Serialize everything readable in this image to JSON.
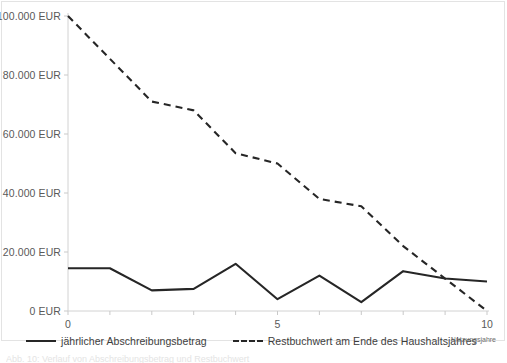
{
  "figure": {
    "title": "",
    "cropped_caption": "Abb. 10: Verlauf von Abschreibungsbetrag und Restbuchwert",
    "frame_color": "#e3e3e3",
    "background": "#ffffff"
  },
  "axes": {
    "y_ticks": [
      "0 EUR",
      "20.000 EUR",
      "40.000 EUR",
      "60.000 EUR",
      "80.000 EUR",
      "100.000 EUR"
    ],
    "y_tick_values": [
      0,
      20000,
      40000,
      60000,
      80000,
      100000
    ],
    "x_ticks_labeled": [
      "0",
      "5",
      "10"
    ],
    "x_tick_values": [
      0,
      1,
      2,
      3,
      4,
      5,
      6,
      7,
      8,
      9,
      10
    ],
    "x_axis_caption": "Nutzungsjahre"
  },
  "legend": {
    "items": [
      {
        "label": "jährlicher Abschreibungsbetrag",
        "style": "solid",
        "color": "#262626"
      },
      {
        "label": "Restbuchwert am Ende des Haushaltsjahres",
        "style": "dashed",
        "color": "#262626"
      }
    ]
  },
  "chart_data": {
    "type": "line",
    "title": "",
    "xlabel": "Nutzungsjahre",
    "ylabel": "EUR",
    "xlim": [
      0,
      10
    ],
    "ylim": [
      0,
      100000
    ],
    "grid": false,
    "legend_position": "bottom",
    "x": [
      0,
      1,
      2,
      3,
      4,
      5,
      6,
      7,
      8,
      9,
      10
    ],
    "series": [
      {
        "name": "jährlicher Abschreibungsbetrag",
        "style": "solid",
        "color": "#262626",
        "values": [
          14500,
          14500,
          7000,
          7500,
          16000,
          4000,
          12000,
          3000,
          13500,
          11000,
          10000
        ]
      },
      {
        "name": "Restbuchwert am Ende des Haushaltsjahres",
        "style": "dashed",
        "color": "#262626",
        "values": [
          100000,
          85500,
          71000,
          68000,
          53500,
          50000,
          38000,
          35500,
          22000,
          11000,
          0
        ]
      }
    ]
  }
}
